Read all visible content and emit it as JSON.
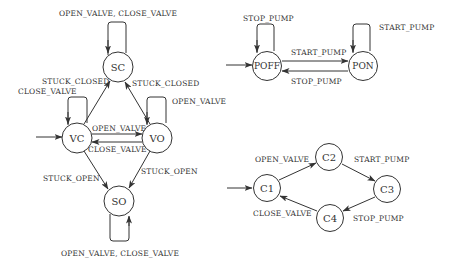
{
  "diagrams": {
    "valve": {
      "states": {
        "sc": "SC",
        "vc": "VC",
        "vo": "VO",
        "so": "SO"
      },
      "edges": {
        "sc_loop": "OPEN_VALVE, CLOSE_VALVE",
        "vc_sc": "STUCK_CLOSED",
        "vc_loop": "CLOSE_VALVE",
        "vo_sc": "STUCK_CLOSED",
        "vo_loop": "OPEN_VALVE",
        "vc_vo": "OPEN_VALVE",
        "vo_vc": "CLOSE_VALVE",
        "vc_so": "STUCK_OPEN",
        "vo_so": "STUCK_OPEN",
        "so_loop": "OPEN_VALVE, CLOSE_VALVE"
      },
      "initial": "VC"
    },
    "pump": {
      "states": {
        "poff": "POFF",
        "pon": "PON"
      },
      "edges": {
        "poff_loop": "STOP_PUMP",
        "pon_loop": "START_PUMP",
        "poff_pon": "START_PUMP",
        "pon_poff": "STOP_PUMP"
      },
      "initial": "POFF"
    },
    "controller": {
      "states": {
        "c1": "C1",
        "c2": "C2",
        "c3": "C3",
        "c4": "C4"
      },
      "edges": {
        "c1_c2": "OPEN_VALVE",
        "c2_c3": "START_PUMP",
        "c3_c4": "STOP_PUMP",
        "c4_c1": "CLOSE_VALVE"
      },
      "initial": "C1"
    }
  }
}
